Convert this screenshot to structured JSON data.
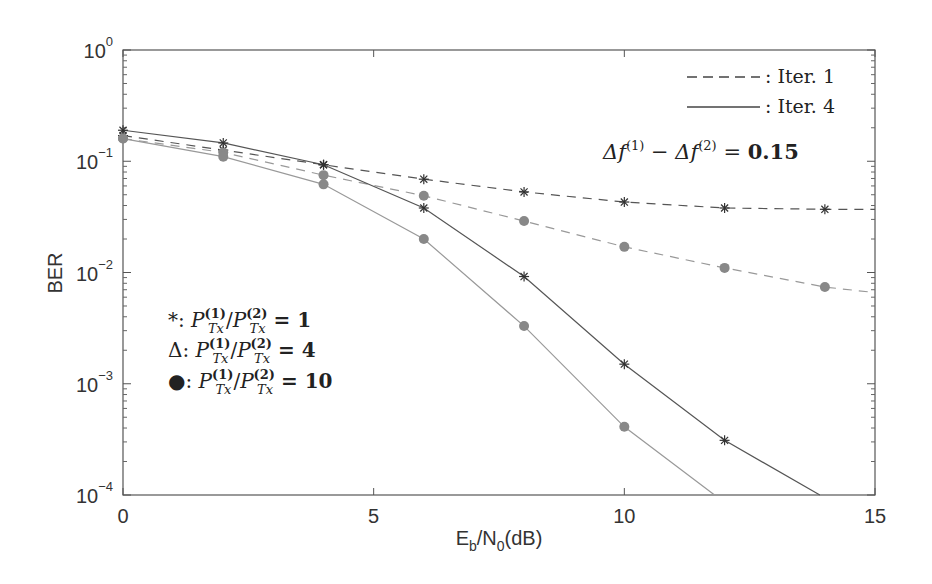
{
  "chart_data": {
    "type": "line",
    "title": "",
    "xlabel": "E_b/N_0(dB)",
    "ylabel": "BER",
    "xlim": [
      0,
      15
    ],
    "ylim": [
      0.0001,
      1
    ],
    "yscale": "log",
    "grid": false,
    "x_ticks": [
      "0",
      "5",
      "10",
      "15"
    ],
    "y_ticks": [
      "10^0",
      "10^-1",
      "10^-2",
      "10^-3",
      "10^-4"
    ],
    "series": [
      {
        "name": "Iter. 1, P_Tx(1)/P_Tx(2) = 1",
        "style": "dashed",
        "marker": "*",
        "x": [
          0,
          2,
          4,
          6,
          8,
          10,
          12,
          14,
          15
        ],
        "values": [
          0.17,
          0.126,
          0.093,
          0.069,
          0.053,
          0.043,
          0.038,
          0.037,
          0.037
        ]
      },
      {
        "name": "Iter. 1, P_Tx(1)/P_Tx(2) = 10",
        "style": "dashed",
        "marker": "dot",
        "x": [
          0,
          2,
          4,
          6,
          8,
          10,
          12,
          14,
          15
        ],
        "values": [
          0.16,
          0.12,
          0.075,
          0.049,
          0.029,
          0.017,
          0.011,
          0.0074,
          0.0066
        ]
      },
      {
        "name": "Iter. 4, P_Tx(1)/P_Tx(2) = 1",
        "style": "solid",
        "marker": "*",
        "x": [
          0,
          2,
          4,
          6,
          8,
          10,
          12,
          13.9
        ],
        "values": [
          0.19,
          0.146,
          0.093,
          0.038,
          0.0092,
          0.0015,
          0.00031,
          0.0001
        ]
      },
      {
        "name": "Iter. 4, P_Tx(1)/P_Tx(2) = 10",
        "style": "solid",
        "marker": "dot",
        "x": [
          0,
          2,
          4,
          6,
          8,
          10,
          11.8
        ],
        "values": [
          0.16,
          0.11,
          0.062,
          0.02,
          0.0033,
          0.00041,
          0.0001
        ]
      }
    ],
    "legend": {
      "line_styles": [
        {
          "style": "dashed",
          "label": ": Iter. 1"
        },
        {
          "style": "solid",
          "label": ": Iter. 4"
        }
      ],
      "annotation": "Δf(1) − Δf(2) = 0.15",
      "markers": [
        {
          "marker": "*",
          "label": "*: P_Tx(1)/P_Tx(2) = 1"
        },
        {
          "marker": "Δ",
          "label": "Δ: P_Tx(1)/P_Tx(2) = 4"
        },
        {
          "marker": "●",
          "label": "●: P_Tx(1)/P_Tx(2) = 10"
        }
      ]
    }
  },
  "labels": {
    "ylabel": "BER",
    "xlabel_main": "E",
    "xlabel_sub1": "b",
    "xlabel_mid": "/N",
    "xlabel_sub2": "0",
    "xlabel_end": "(dB)",
    "iter1": ": Iter. 1",
    "iter4": ": Iter. 4",
    "delta_f": "0.15",
    "m1_sym": "*:",
    "m1_val": "1",
    "m2_sym": "Δ:",
    "m2_val": "4",
    "m3_sym": "●:",
    "m3_val": "10"
  }
}
